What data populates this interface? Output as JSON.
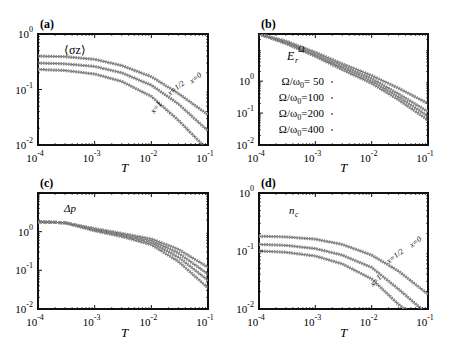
{
  "chart_data": [
    {
      "panel": "(a)",
      "type": "line",
      "title": "",
      "annotation": "⟨σz⟩",
      "xlabel": "T",
      "ylabel": "",
      "xscale": "log",
      "yscale": "log",
      "xlim": [
        0.0001,
        0.1
      ],
      "ylim": [
        0.01,
        1
      ],
      "xticks": [
        "10-4",
        "10-3",
        "10-2",
        "10-1"
      ],
      "yticks": [
        "10-2",
        "10-1",
        "100"
      ],
      "grid": false,
      "x": [
        0.0001,
        0.0003,
        0.001,
        0.003,
        0.01,
        0.03,
        0.1
      ],
      "series": [
        {
          "name": "x=0",
          "values": [
            0.4,
            0.39,
            0.35,
            0.27,
            0.17,
            0.085,
            0.035
          ]
        },
        {
          "name": "x=1/2",
          "values": [
            0.3,
            0.29,
            0.26,
            0.2,
            0.12,
            0.055,
            0.018
          ]
        },
        {
          "name": "x=1",
          "values": [
            0.23,
            0.22,
            0.19,
            0.14,
            0.075,
            0.028,
            0.008
          ]
        }
      ]
    },
    {
      "panel": "(b)",
      "type": "line",
      "annotation": "ErΩ",
      "xlabel": "T",
      "xscale": "log",
      "yscale": "log",
      "xlim": [
        0.0001,
        0.1
      ],
      "ylim": [
        0.01,
        30
      ],
      "xticks": [
        "10-4",
        "10-3",
        "10-2",
        "10-1"
      ],
      "yticks": [
        "10-2",
        "10-1",
        "100"
      ],
      "grid": false,
      "legend": [
        "Ω/ω0= 50",
        "Ω/ω0=100",
        "Ω/ω0=200",
        "Ω/ω0=400"
      ],
      "legend_position": "center-left",
      "x": [
        0.0001,
        0.0003,
        0.001,
        0.003,
        0.01,
        0.03,
        0.1
      ],
      "series": [
        {
          "name": "Ω/ω0= 50",
          "values": [
            30,
            18,
            8,
            3.5,
            1.5,
            0.6,
            0.2
          ]
        },
        {
          "name": "Ω/ω0=100",
          "values": [
            30,
            17,
            7,
            3.0,
            1.2,
            0.4,
            0.11
          ]
        },
        {
          "name": "Ω/ω0=200",
          "values": [
            30,
            16,
            6.5,
            2.6,
            1.0,
            0.32,
            0.08
          ]
        },
        {
          "name": "Ω/ω0=400",
          "values": [
            30,
            15,
            6,
            2.3,
            0.85,
            0.26,
            0.06
          ]
        }
      ]
    },
    {
      "panel": "(c)",
      "type": "line",
      "annotation": "Δp",
      "xlabel": "T",
      "xscale": "log",
      "yscale": "log",
      "xlim": [
        0.0001,
        0.1
      ],
      "ylim": [
        0.01,
        10
      ],
      "xticks": [
        "10-4",
        "10-3",
        "10-2",
        "10-1"
      ],
      "yticks": [
        "10-2",
        "10-1",
        "100"
      ],
      "grid": false,
      "x": [
        0.0001,
        0.0003,
        0.001,
        0.003,
        0.01,
        0.03,
        0.1
      ],
      "series": [
        {
          "name": "s1",
          "values": [
            1.8,
            1.7,
            1.2,
            0.9,
            0.65,
            0.35,
            0.12
          ]
        },
        {
          "name": "s2",
          "values": [
            1.8,
            1.7,
            1.15,
            0.85,
            0.58,
            0.28,
            0.08
          ]
        },
        {
          "name": "s3",
          "values": [
            1.8,
            1.7,
            1.1,
            0.8,
            0.52,
            0.22,
            0.055
          ]
        },
        {
          "name": "s4",
          "values": [
            1.8,
            1.7,
            1.05,
            0.75,
            0.46,
            0.17,
            0.035
          ]
        }
      ]
    },
    {
      "panel": "(d)",
      "type": "line",
      "annotation": "nc",
      "xlabel": "T",
      "xscale": "log",
      "yscale": "log",
      "xlim": [
        0.0001,
        0.1
      ],
      "ylim": [
        0.01,
        1
      ],
      "xticks": [
        "10-4",
        "10-3",
        "10-2",
        "10-1"
      ],
      "yticks": [
        "10-2",
        "10-1",
        "100"
      ],
      "grid": false,
      "x": [
        0.0001,
        0.0003,
        0.001,
        0.003,
        0.01,
        0.03,
        0.1
      ],
      "series": [
        {
          "name": "x=0",
          "values": [
            0.18,
            0.175,
            0.16,
            0.13,
            0.085,
            0.045,
            0.018
          ]
        },
        {
          "name": "x=1/2",
          "values": [
            0.13,
            0.125,
            0.11,
            0.085,
            0.052,
            0.022,
            0.008
          ]
        },
        {
          "name": "x=1",
          "values": [
            0.1,
            0.095,
            0.082,
            0.06,
            0.033,
            0.012,
            0.005
          ]
        }
      ]
    }
  ],
  "panels": {
    "a": {
      "label": "(a)",
      "quantity": "⟨σz⟩",
      "xlabel": "T",
      "curve_labels": [
        "x=0",
        "x=1/2",
        "x=1"
      ]
    },
    "b": {
      "label": "(b)",
      "quantity_main": "E",
      "quantity_sub": "r",
      "quantity_sup": "Ω",
      "xlabel": "T",
      "legend": [
        {
          "prefix": "Ω/ω",
          "sub": "0",
          "suffix": "= 50"
        },
        {
          "prefix": "Ω/ω",
          "sub": "0",
          "suffix": "=100"
        },
        {
          "prefix": "Ω/ω",
          "sub": "0",
          "suffix": "=200"
        },
        {
          "prefix": "Ω/ω",
          "sub": "0",
          "suffix": "=400"
        }
      ]
    },
    "c": {
      "label": "(c)",
      "quantity": "Δp",
      "xlabel": "T"
    },
    "d": {
      "label": "(d)",
      "quantity_main": "n",
      "quantity_sub": "c",
      "xlabel": "T",
      "curve_labels": [
        "x=0",
        "x=1/2",
        "x=1"
      ]
    }
  },
  "axis": {
    "x_ticks": [
      {
        "base": "10",
        "exp": "-4"
      },
      {
        "base": "10",
        "exp": "-3"
      },
      {
        "base": "10",
        "exp": "-2"
      },
      {
        "base": "10",
        "exp": "-1"
      }
    ],
    "y_ticks": [
      {
        "base": "10",
        "exp": "-2"
      },
      {
        "base": "10",
        "exp": "-1"
      },
      {
        "base": "10",
        "exp": "0"
      }
    ]
  },
  "colors": {
    "frame": "#111111",
    "curve": "#8a8a8a",
    "line": "#555555",
    "text": "#111111"
  }
}
